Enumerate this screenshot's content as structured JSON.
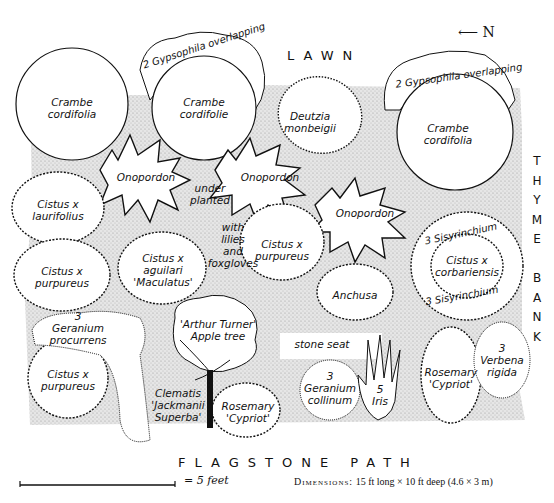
{
  "compass": {
    "arrow": "⟵",
    "label": "N"
  },
  "edges": {
    "top": "LAWN",
    "bottom": "FLAGSTONE PATH",
    "right": [
      "T",
      "H",
      "Y",
      "M",
      "E",
      "",
      "B",
      "A",
      "N",
      "K"
    ]
  },
  "scale": {
    "label": "= 5 feet"
  },
  "dimensions": {
    "key": "Dimensions:",
    "value": "15 ft long × 10 ft deep (4.6 × 3 m)"
  },
  "plants": {
    "crambe_1": [
      "Crambe",
      "cordifolia"
    ],
    "crambe_2": [
      "Crambe",
      "cordifolie"
    ],
    "crambe_3": [
      "Crambe",
      "cordifolia"
    ],
    "gypsophila_1": "2 Gypsophila overlapping",
    "gypsophila_2": "2 Gypsophila overlapping",
    "deutzia": [
      "Deutzia",
      "monbeigii"
    ],
    "onopordon_1": "Onopordon",
    "onopordon_2": "Onopordon",
    "onopordon_3": "Onopordon",
    "underplanted": [
      "under",
      "planted"
    ],
    "lilies": [
      "with",
      "lilies",
      "and",
      "foxgloves"
    ],
    "cistus_laurifolius": [
      "Cistus x",
      "laurifolius"
    ],
    "cistus_purpureus_1": [
      "Cistus x",
      "purpureus"
    ],
    "cistus_aguilari": [
      "Cistus x",
      "aguilari",
      "'Maculatus'"
    ],
    "cistus_purpureus_2": [
      "Cistus x",
      "purpureus"
    ],
    "anchusa": "Anchusa",
    "sisyrinchium_1": "3 Sisyrinchium",
    "cistus_corbariensis": [
      "Cistus x",
      "corbariensis"
    ],
    "sisyrinchium_2": "3 Sisyrinchium",
    "geranium_procurrens": [
      "3",
      "Geranium",
      "procurrens"
    ],
    "cistus_purpureus_3": [
      "Cistus x",
      "purpureus"
    ],
    "apple_tree": [
      "'Arthur Turner'",
      "Apple tree"
    ],
    "clematis": [
      "Clematis",
      "'Jackmanii",
      "Superba'"
    ],
    "rosemary_1": [
      "Rosemary",
      "'Cypriot'"
    ],
    "stone_seat": "stone seat",
    "geranium_collinum": [
      "3",
      "Geranium",
      "collinum"
    ],
    "iris": [
      "5",
      "Iris"
    ],
    "rosemary_2": [
      "Rosemary",
      "'Cypriot'"
    ],
    "verbena": [
      "3",
      "Verbena",
      "rigida"
    ]
  },
  "colors": {
    "ink": "#111111",
    "stipple": "#d9d9d9",
    "paper": "#ffffff"
  }
}
